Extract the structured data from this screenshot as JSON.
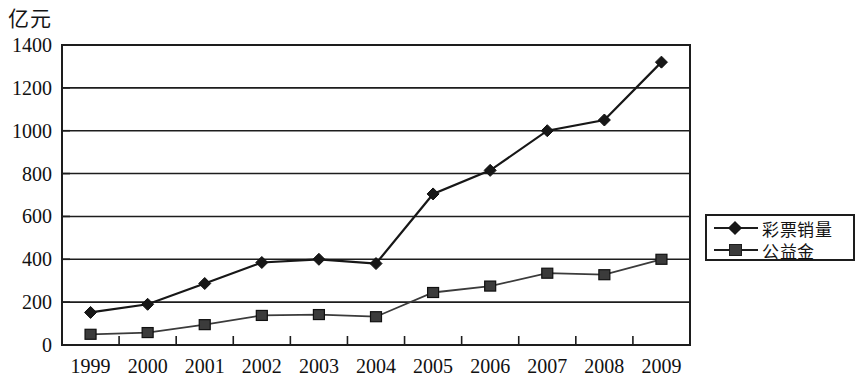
{
  "chart_data": {
    "type": "line",
    "title": "",
    "subtitle": "",
    "unit_label": "亿元",
    "xlabel": "",
    "ylabel": "亿元",
    "categories": [
      "1999",
      "2000",
      "2001",
      "2002",
      "2003",
      "2004",
      "2005",
      "2006",
      "2007",
      "2008",
      "2009"
    ],
    "ylim": [
      0,
      1400
    ],
    "yticks": [
      "0",
      "200",
      "400",
      "600",
      "800",
      "1000",
      "1200",
      "1400"
    ],
    "ytick_values": [
      0,
      200,
      400,
      600,
      800,
      1000,
      1200,
      1400
    ],
    "grid": true,
    "grid_axis": "y",
    "legend_position": "right",
    "series": [
      {
        "name": "彩票销量",
        "marker": "diamond",
        "color": "#171717",
        "values": [
          152,
          190,
          287,
          385,
          400,
          380,
          705,
          815,
          1000,
          1050,
          1320
        ]
      },
      {
        "name": "公益金",
        "marker": "square",
        "color": "#3b3b3b",
        "values": [
          50,
          58,
          95,
          138,
          142,
          132,
          245,
          275,
          335,
          328,
          400
        ]
      }
    ]
  },
  "legend": {
    "items": [
      {
        "label": "彩票销量",
        "marker": "diamond"
      },
      {
        "label": "公益金",
        "marker": "square"
      }
    ]
  }
}
